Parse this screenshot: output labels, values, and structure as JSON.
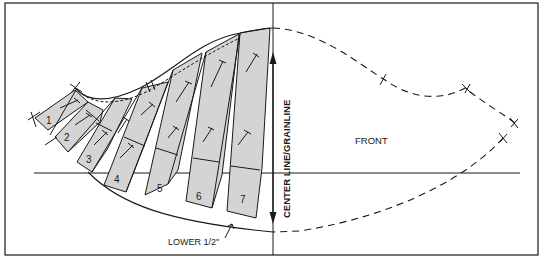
{
  "diagram": {
    "type": "sewing-pattern-slash-and-spread",
    "labels": {
      "front": "FRONT",
      "center_grainline": "CENTER LINE/GRAINLINE",
      "lower_note": "LOWER 1/2\""
    },
    "sections": [
      {
        "id": 1,
        "label": "1"
      },
      {
        "id": 2,
        "label": "2"
      },
      {
        "id": 3,
        "label": "3"
      },
      {
        "id": 4,
        "label": "4"
      },
      {
        "id": 5,
        "label": "5"
      },
      {
        "id": 6,
        "label": "6"
      },
      {
        "id": 7,
        "label": "7"
      }
    ],
    "colors": {
      "line": "#1a1a1a",
      "section_fill": "#d4d4d4",
      "background": "#ffffff"
    }
  }
}
